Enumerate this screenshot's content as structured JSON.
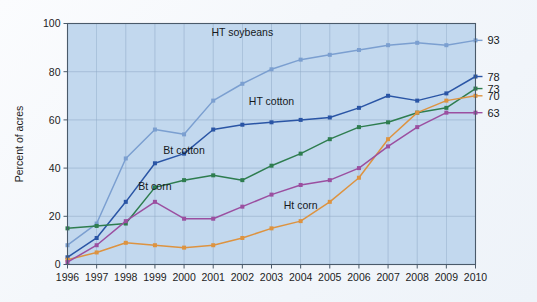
{
  "chart_data": {
    "type": "line",
    "title": "",
    "xlabel": "",
    "ylabel": "Percent of acres",
    "x": [
      1996,
      1997,
      1998,
      1999,
      2000,
      2001,
      2002,
      2003,
      2004,
      2005,
      2006,
      2007,
      2008,
      2009,
      2010
    ],
    "xlim": [
      1996,
      2010
    ],
    "ylim": [
      0,
      100
    ],
    "yticks": [
      0,
      20,
      40,
      60,
      80,
      100
    ],
    "xticks": [
      "1996",
      "1997",
      "1998",
      "1999",
      "2000",
      "2001",
      "2002",
      "2003",
      "2004",
      "2005",
      "2006",
      "2007",
      "2008",
      "2009",
      "2010"
    ],
    "grid": true,
    "legend": "inline-annotations",
    "series": [
      {
        "name": "HT soybeans",
        "color": "#7b9fd0",
        "values": [
          8,
          17,
          44,
          56,
          54,
          68,
          75,
          81,
          85,
          87,
          89,
          91,
          92,
          91,
          93
        ],
        "end_value": 93,
        "label_x": 2002,
        "label_y": 95
      },
      {
        "name": "HT cotton",
        "color": "#2a55a5",
        "values": [
          3,
          11,
          26,
          42,
          46,
          56,
          58,
          59,
          60,
          61,
          65,
          70,
          68,
          71,
          78
        ],
        "end_value": 78,
        "label_x": 2003,
        "label_y": 66
      },
      {
        "name": "Bt cotton",
        "color": "#2e7d4f",
        "values": [
          15,
          16,
          17,
          32,
          35,
          37,
          35,
          41,
          46,
          52,
          57,
          59,
          63,
          65,
          73
        ],
        "end_value": 73,
        "label_x": 2000,
        "label_y": 46
      },
      {
        "name": "Ht corn",
        "color": "#dd9340",
        "values": [
          2,
          5,
          9,
          8,
          7,
          8,
          11,
          15,
          18,
          26,
          36,
          52,
          63,
          68,
          70
        ],
        "end_value": 70,
        "label_x": 2004,
        "label_y": 23
      },
      {
        "name": "Bt corn",
        "color": "#9b4fa0",
        "values": [
          1,
          8,
          18,
          26,
          19,
          19,
          24,
          29,
          33,
          35,
          40,
          49,
          57,
          63,
          63
        ],
        "end_value": 63,
        "label_x": 1999,
        "label_y": 31
      }
    ],
    "end_labels": [
      93,
      78,
      73,
      70,
      63
    ]
  },
  "axes": {
    "y_title": "Percent of acres",
    "y_ticks": [
      "0",
      "20",
      "40",
      "60",
      "80",
      "100"
    ],
    "x_ticks": [
      "1996",
      "1997",
      "1998",
      "1999",
      "2000",
      "2001",
      "2002",
      "2003",
      "2004",
      "2005",
      "2006",
      "2007",
      "2008",
      "2009",
      "2010"
    ]
  },
  "annotations": {
    "ht_soybeans": "HT soybeans",
    "ht_cotton": "HT cotton",
    "bt_cotton": "Bt cotton",
    "bt_corn": "Bt corn",
    "ht_corn": "Ht corn"
  },
  "colors": {
    "plot_background": "#c2d8ee",
    "grid": "#8fa9c6",
    "frame": "#4a5a6a",
    "ht_soybeans": "#7b9fd0",
    "ht_cotton": "#2a55a5",
    "bt_cotton": "#2e7d4f",
    "ht_corn": "#dd9340",
    "bt_corn": "#9b4fa0"
  }
}
